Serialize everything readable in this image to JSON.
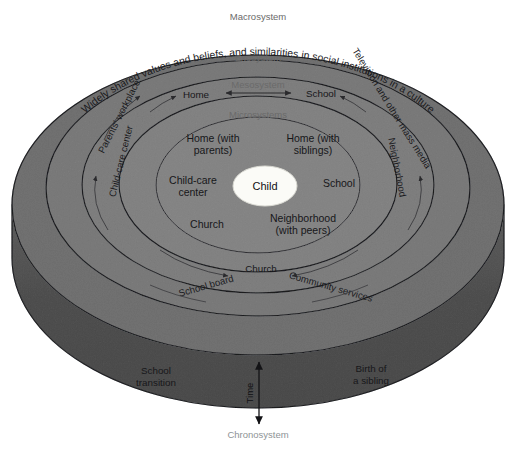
{
  "diagram": {
    "center": {
      "label": "Child"
    },
    "system_labels": {
      "macrosystem": "Macrosystem",
      "exosystem": "Exosystem",
      "mesosystem": "Mesosystem",
      "microsystems": "Microsystems",
      "chronosystem": "Chronosystem"
    },
    "microsystem_nodes": [
      {
        "id": "home-parents",
        "line1": "Home (with",
        "line2": "parents)"
      },
      {
        "id": "home-siblings",
        "line1": "Home (with",
        "line2": "siblings)"
      },
      {
        "id": "child-care-center",
        "line1": "Child-care",
        "line2": "center"
      },
      {
        "id": "school",
        "line1": "School",
        "line2": ""
      },
      {
        "id": "church",
        "line1": "Church",
        "line2": ""
      },
      {
        "id": "neighborhood-peers",
        "line1": "Neighborhood",
        "line2": "(with peers)"
      }
    ],
    "mesosystem_nodes": [
      {
        "id": "meso-home",
        "label": "Home"
      },
      {
        "id": "meso-school",
        "label": "School"
      },
      {
        "id": "meso-church",
        "label": "Church"
      }
    ],
    "exosystem_nodes": [
      {
        "id": "exo-parents-workplace",
        "label": "Parents' workplace"
      },
      {
        "id": "exo-child-care-center",
        "label": "Child-care center"
      },
      {
        "id": "exo-neighborhood",
        "label": "Neighborhood"
      },
      {
        "id": "exo-school-board",
        "label": "School board"
      },
      {
        "id": "exo-community-services",
        "label": "Community services"
      }
    ],
    "macrosystem_nodes": [
      {
        "id": "macro-values",
        "label": "Widely shared values and beliefs, and similarities in social institutions in a culture"
      },
      {
        "id": "macro-media",
        "label": "Television and other mass media"
      }
    ],
    "chronosystem": {
      "time_axis_label": "Time",
      "left_event": {
        "line1": "School",
        "line2": "transition"
      },
      "right_event": {
        "line1": "Birth of",
        "line2": "a sibling"
      }
    },
    "colors": {
      "background": "#ffffff",
      "ring_macro": "#a9a9a9",
      "ring_exo": "#b0b0b0",
      "ring_meso": "#b3b3b3",
      "ring_micro": "#b6b6b6",
      "center_fill": "#fbfbf7",
      "cylinder_wall": "#909090",
      "outline": "#55565a",
      "text_dark": "#17171a",
      "text_faint": "#6a6a6a"
    }
  }
}
